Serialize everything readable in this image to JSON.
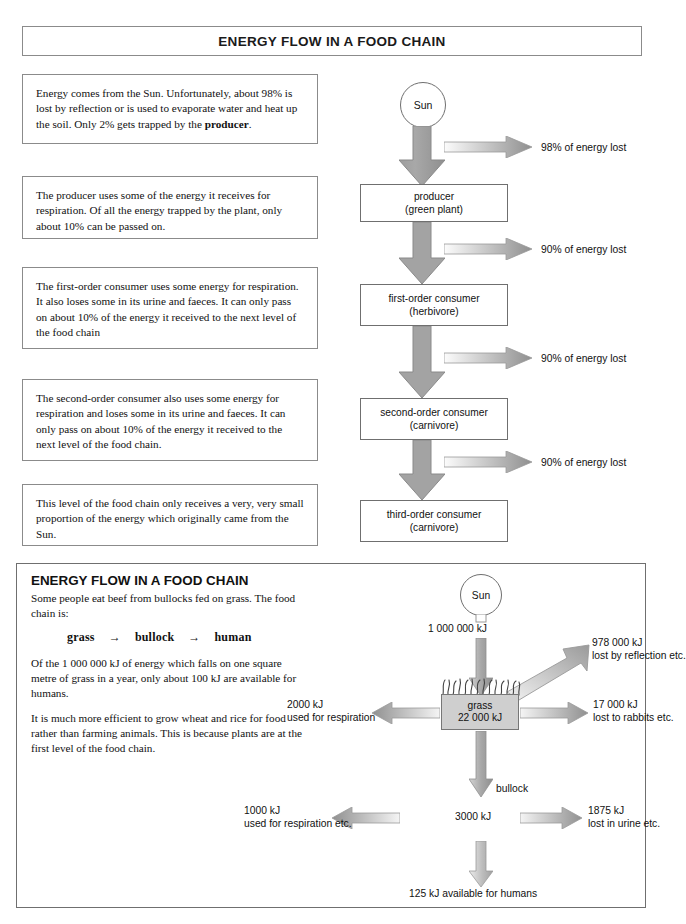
{
  "title": "ENERGY FLOW IN A FOOD CHAIN",
  "explanations": [
    {
      "id": "exp0",
      "text_before": "Energy comes from the Sun. Unfortunately, about 98% is lost by reflection or is used to evaporate water and heat up the soil. Only 2% gets trapped by the ",
      "bold": "producer",
      "text_after": "."
    },
    {
      "id": "exp1",
      "text_before": "The producer uses some of the energy it receives for respiration. Of all the energy trapped by the plant, only about 10% can be passed on.",
      "bold": "",
      "text_after": ""
    },
    {
      "id": "exp2",
      "text_before": "The first-order consumer uses some energy for respiration. It also loses some in its urine and faeces. It can only pass on about 10% of the energy it received to the next level of the food chain",
      "bold": "",
      "text_after": ""
    },
    {
      "id": "exp3",
      "text_before": "The second-order consumer also uses some energy for respiration and loses some in its urine and faeces. It can only pass on about 10% of the energy it received to the next level of the food chain.",
      "bold": "",
      "text_after": ""
    },
    {
      "id": "exp4",
      "text_before": "This level of the food chain only receives a very, very small proportion of the energy which originally came from the Sun.",
      "bold": "",
      "text_after": ""
    }
  ],
  "chain": {
    "sun_label": "Sun",
    "boxes": [
      {
        "line1": "producer",
        "line2": "(green plant)"
      },
      {
        "line1": "first-order consumer",
        "line2": "(herbivore)"
      },
      {
        "line1": "second-order consumer",
        "line2": "(carnivore)"
      },
      {
        "line1": "third-order consumer",
        "line2": "(carnivore)"
      }
    ],
    "losses": [
      {
        "label": "98% of energy lost"
      },
      {
        "label": "90% of energy lost"
      },
      {
        "label": "90% of energy lost"
      },
      {
        "label": "90% of energy lost"
      }
    ]
  },
  "bottom": {
    "title": "ENERGY FLOW IN A FOOD CHAIN",
    "para0": "Some people eat beef from bullocks fed on grass. The food chain is:",
    "food_chain": [
      "grass",
      "→",
      "bullock",
      "→",
      "human"
    ],
    "para1": "Of the 1 000 000 kJ of energy which falls on one square metre of grass in a year, only about 100 kJ are available for humans.",
    "para2": "It is much more efficient to grow wheat and rice for food rather than farming animals. This is because plants are at the first level of the food chain.",
    "diagram": {
      "sun_label": "Sun",
      "sun_energy": "1 000 000 kJ",
      "reflection_line1": "978 000 kJ",
      "reflection_line2": "lost by reflection etc.",
      "grass_line1": "grass",
      "grass_line2": "22 000 kJ",
      "respiration_line1": "2000 kJ",
      "respiration_line2": "used for respiration",
      "rabbits_line1": "17 000 kJ",
      "rabbits_line2": "lost to rabbits etc.",
      "bullock_label": "bullock",
      "bullock_energy": "3000 kJ",
      "resp2_line1": "1000 kJ",
      "resp2_line2": "used for respiration etc.",
      "urine_line1": "1875 kJ",
      "urine_line2": "lost in urine etc.",
      "final_label": "125 kJ available for humans"
    }
  },
  "colors": {
    "arrow_dark": "#8a8a8a",
    "arrow_light": "#f0f0f0",
    "border": "#6f6f6f",
    "grass_fill": "#cfcfcf"
  }
}
